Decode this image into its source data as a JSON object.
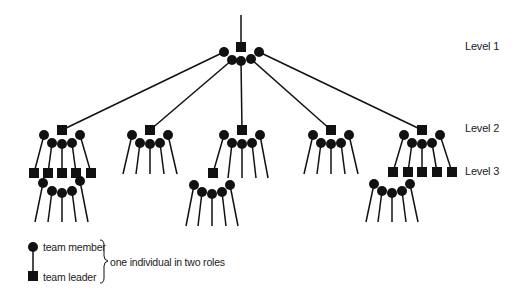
{
  "levels": [
    {
      "label": "Level 1",
      "y": 47
    },
    {
      "label": "Level 2",
      "y": 128
    },
    {
      "label": "Level 3",
      "y": 172
    }
  ],
  "legend": {
    "member_label": "team member",
    "leader_label": "team leader",
    "brace_label": "one individual in two roles"
  },
  "colors": {
    "ink": "#111111",
    "text": "#222222",
    "background": "#ffffff"
  },
  "structure": {
    "top": {
      "leader": [
        241,
        47
      ],
      "stem_top": 15,
      "members": [
        [
          224,
          52
        ],
        [
          232,
          60
        ],
        [
          241,
          61
        ],
        [
          251,
          59
        ],
        [
          259,
          52
        ]
      ]
    },
    "level2_teams": [
      {
        "leader": [
          62,
          130
        ],
        "parent_member": 0,
        "members": [
          [
            44,
            135
          ],
          [
            52,
            143
          ],
          [
            62,
            144
          ],
          [
            72,
            143
          ],
          [
            80,
            135
          ]
        ],
        "children": "level3",
        "level3_leaders": [
          [
            34,
            173
          ],
          [
            48,
            173
          ],
          [
            62,
            173
          ],
          [
            76,
            173
          ],
          [
            91,
            173
          ]
        ],
        "level3_members": [
          [
            43,
            183
          ],
          [
            52,
            191
          ],
          [
            62,
            193
          ],
          [
            72,
            191
          ],
          [
            80,
            181
          ]
        ]
      },
      {
        "leader": [
          150,
          130
        ],
        "parent_member": 1,
        "members": [
          [
            132,
            135
          ],
          [
            140,
            143
          ],
          [
            150,
            144
          ],
          [
            160,
            143
          ],
          [
            168,
            135
          ]
        ],
        "children": "open"
      },
      {
        "leader": [
          242,
          130
        ],
        "parent_member": 2,
        "members": [
          [
            224,
            135
          ],
          [
            232,
            143
          ],
          [
            242,
            144
          ],
          [
            252,
            143
          ],
          [
            260,
            135
          ]
        ],
        "children": "one-leader",
        "level3_leaders": [
          [
            213,
            173
          ]
        ],
        "level3_members": [
          [
            194,
            185
          ],
          [
            202,
            192
          ],
          [
            212,
            194
          ],
          [
            222,
            192
          ],
          [
            230,
            185
          ]
        ]
      },
      {
        "leader": [
          331,
          130
        ],
        "parent_member": 3,
        "members": [
          [
            313,
            135
          ],
          [
            321,
            143
          ],
          [
            331,
            144
          ],
          [
            341,
            143
          ],
          [
            349,
            135
          ]
        ],
        "children": "open"
      },
      {
        "leader": [
          422,
          130
        ],
        "parent_member": 4,
        "members": [
          [
            404,
            135
          ],
          [
            412,
            143
          ],
          [
            422,
            144
          ],
          [
            432,
            143
          ],
          [
            440,
            135
          ]
        ],
        "children": "level3",
        "level3_leaders": [
          [
            393,
            172
          ],
          [
            408,
            172
          ],
          [
            422,
            172
          ],
          [
            437,
            172
          ],
          [
            452,
            172
          ]
        ],
        "level3_members": [
          [
            374,
            184
          ],
          [
            382,
            191
          ],
          [
            392,
            193
          ],
          [
            402,
            191
          ],
          [
            410,
            184
          ]
        ]
      }
    ]
  }
}
